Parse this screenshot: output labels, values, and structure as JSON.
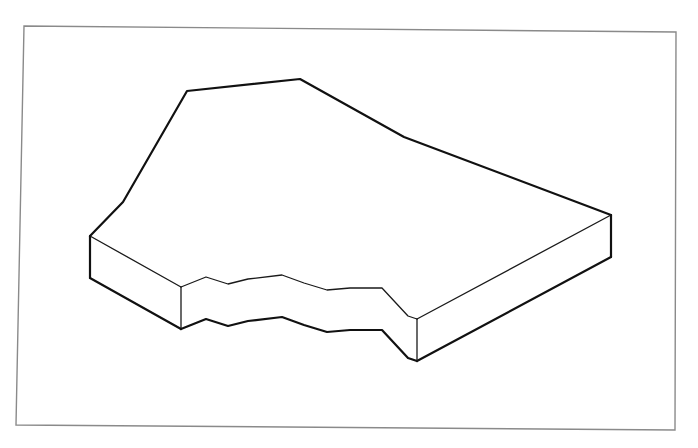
{
  "figure": {
    "background_color": "#ffffff",
    "line_color": "#111111",
    "frame_color": "#8a8a8a",
    "frame": {
      "top_left": [
        24,
        26
      ],
      "top_right": [
        676,
        32
      ],
      "bottom_right": [
        675,
        430
      ],
      "bottom_left": [
        16,
        425
      ]
    },
    "slab": {
      "thickness_px": 42,
      "top_outline": [
        [
          90,
          236
        ],
        [
          123,
          202
        ],
        [
          187,
          91
        ],
        [
          300,
          79
        ],
        [
          404,
          137
        ],
        [
          611,
          215
        ]
      ],
      "left_block": {
        "top_edge": [
          [
            90,
            236
          ],
          [
            181,
            287
          ]
        ],
        "bottom_edge": [
          [
            90,
            278
          ],
          [
            181,
            329
          ]
        ]
      },
      "right_block": {
        "top_edge": [
          [
            417,
            319
          ],
          [
            611,
            215
          ]
        ],
        "bottom_edge": [
          [
            417,
            361
          ],
          [
            611,
            257
          ]
        ]
      },
      "broken_edge_top": [
        [
          181,
          287
        ],
        [
          206,
          277
        ],
        [
          228,
          284
        ],
        [
          248,
          279
        ],
        [
          282,
          275
        ],
        [
          304,
          283
        ],
        [
          327,
          290
        ],
        [
          350,
          288
        ],
        [
          382,
          288
        ],
        [
          395,
          302
        ],
        [
          408,
          316
        ],
        [
          417,
          319
        ]
      ],
      "broken_edge_bottom": [
        [
          181,
          329
        ],
        [
          206,
          319
        ],
        [
          228,
          326
        ],
        [
          248,
          321
        ],
        [
          282,
          317
        ],
        [
          304,
          325
        ],
        [
          327,
          332
        ],
        [
          350,
          330
        ],
        [
          382,
          330
        ],
        [
          395,
          344
        ],
        [
          408,
          358
        ],
        [
          417,
          361
        ]
      ]
    }
  }
}
